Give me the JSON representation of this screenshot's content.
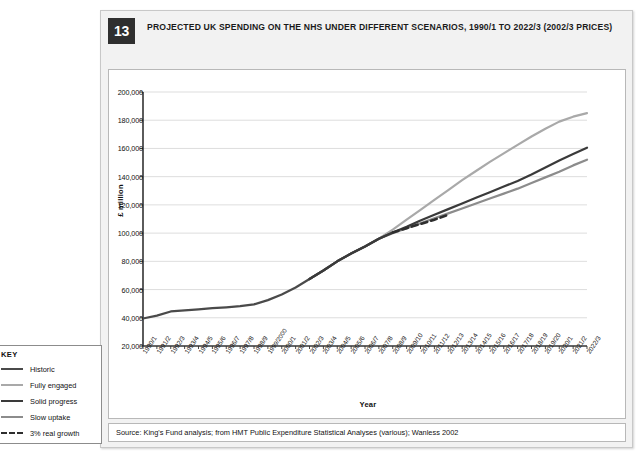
{
  "figure": {
    "number": "13",
    "title": "PROJECTED UK SPENDING ON THE NHS UNDER DIFFERENT SCENARIOS, 1990/1 TO 2022/3 (2002/3 PRICES)",
    "source": "Source: King's Fund analysis; from HMT Public Expenditure Statistical Analyses (various); Wanless 2002"
  },
  "key": {
    "title": "KEY",
    "items": [
      {
        "label": "Historic",
        "color": "#4a4a4a",
        "style": "solid",
        "width": 2.2
      },
      {
        "label": "Fully engaged",
        "color": "#a9a9a9",
        "style": "solid",
        "width": 2.0
      },
      {
        "label": "Solid progress",
        "color": "#3a3a3a",
        "style": "solid",
        "width": 2.2
      },
      {
        "label": "Slow uptake",
        "color": "#8c8c8c",
        "style": "solid",
        "width": 2.0
      },
      {
        "label": "3% real growth",
        "color": "#2e2e2e",
        "style": "dashed",
        "width": 2.4
      }
    ]
  },
  "chart_data": {
    "type": "line",
    "title": "PROJECTED UK SPENDING ON THE NHS UNDER DIFFERENT SCENARIOS, 1990/1 TO 2022/3 (2002/3 PRICES)",
    "xlabel": "Year",
    "ylabel": "£ million",
    "ylim": [
      20000,
      200000
    ],
    "ytick_step": 20000,
    "ytick_labels": [
      "200,000",
      "180,000",
      "160,000",
      "140,000",
      "120,000",
      "100,000",
      "80,000",
      "60,000",
      "40,000",
      "20,000"
    ],
    "ytick_values": [
      200000,
      180000,
      160000,
      140000,
      120000,
      100000,
      80000,
      60000,
      40000,
      20000
    ],
    "grid": "horizontal",
    "legend_position": "outside-left-bottom",
    "categories": [
      "1990/1",
      "1991/2",
      "1992/3",
      "1993/4",
      "1994/5",
      "1995/6",
      "1996/7",
      "1997/8",
      "1998/9",
      "1999/2000",
      "2000/1",
      "2001/2",
      "2002/3",
      "2003/4",
      "2004/5",
      "2005/6",
      "2006/7",
      "2007/8",
      "2008/9",
      "2009/10",
      "2010/11",
      "2011/12",
      "2012/13",
      "2013/14",
      "2014/15",
      "2015/16",
      "2016/17",
      "2017/18",
      "2018/19",
      "2019/20",
      "2020/1",
      "2021/2",
      "2022/3"
    ],
    "series": [
      {
        "name": "Historic",
        "color": "#4a4a4a",
        "style": "solid",
        "values": [
          39500,
          41500,
          44500,
          45200,
          46000,
          46800,
          47400,
          48200,
          49500,
          52500,
          56500,
          61500,
          67500,
          73500,
          80000,
          85500,
          90500,
          96000,
          100500,
          null,
          null,
          null,
          null,
          null,
          null,
          null,
          null,
          null,
          null,
          null,
          null,
          null,
          null
        ]
      },
      {
        "name": "Fully engaged",
        "color": "#a9a9a9",
        "style": "solid",
        "values": [
          null,
          null,
          null,
          null,
          null,
          null,
          null,
          null,
          null,
          null,
          null,
          null,
          67500,
          73500,
          80000,
          85500,
          90500,
          96000,
          102500,
          109500,
          116500,
          123500,
          130500,
          137500,
          144000,
          150500,
          156500,
          162500,
          168500,
          174000,
          179000,
          182500,
          185000
        ]
      },
      {
        "name": "Solid progress",
        "color": "#3a3a3a",
        "style": "solid",
        "values": [
          null,
          null,
          null,
          null,
          null,
          null,
          null,
          null,
          null,
          null,
          null,
          null,
          67500,
          73500,
          80000,
          85500,
          90500,
          96000,
          100500,
          104500,
          109000,
          113000,
          117000,
          121000,
          125000,
          129000,
          133000,
          137000,
          141500,
          146500,
          151500,
          156000,
          160500
        ]
      },
      {
        "name": "Slow uptake",
        "color": "#8c8c8c",
        "style": "solid",
        "values": [
          null,
          null,
          null,
          null,
          null,
          null,
          null,
          null,
          null,
          null,
          null,
          null,
          67500,
          73500,
          80000,
          85500,
          90500,
          96000,
          100000,
          103500,
          107000,
          110500,
          114000,
          117500,
          121000,
          124500,
          128000,
          131500,
          135500,
          139500,
          143500,
          148000,
          152000
        ]
      },
      {
        "name": "3% real growth",
        "color": "#2e2e2e",
        "style": "dashed",
        "values": [
          null,
          null,
          null,
          null,
          null,
          null,
          null,
          null,
          null,
          null,
          null,
          null,
          null,
          null,
          null,
          null,
          null,
          null,
          100500,
          103500,
          106500,
          109500,
          113000,
          null,
          null,
          null,
          null,
          null,
          null,
          null,
          null,
          null,
          null
        ]
      }
    ]
  }
}
